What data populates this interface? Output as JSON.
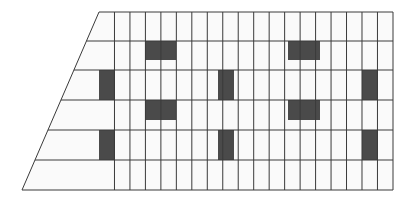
{
  "figure": {
    "background_color": "#ffffff",
    "line_color": "#3a3a3a",
    "fill_color": "#4a4a4a",
    "pane_color": "#fafafa",
    "line_width": 1
  },
  "geometry": {
    "outline_name": "facade-outline",
    "points": [
      {
        "x": 99,
        "y": 12
      },
      {
        "x": 393,
        "y": 12
      },
      {
        "x": 393,
        "y": 190
      },
      {
        "x": 22,
        "y": 190
      }
    ],
    "apex_top_left": {
      "x": 99,
      "y": 12
    },
    "base_bottom_left": {
      "x": 22,
      "y": 190
    },
    "right_edge_x": 393,
    "top_edge_y": 12,
    "bottom_edge_y": 190
  },
  "grid": {
    "name": "window-grid",
    "columns": 19,
    "rows": 6,
    "column_width": 15.47,
    "row_boundaries_y": [
      12,
      41,
      70,
      100,
      130,
      160,
      190
    ],
    "column_start_x": 99,
    "note": "Columns run full height on the right; on the left they are clipped by the slanted edge so lower rows extend further left."
  },
  "left_extension": {
    "name": "slanted-left-bays",
    "description": "Below each row boundary the facade widens to the left along the diagonal; extra vertical mullions fill these bays.",
    "bay_columns_per_row": [
      0,
      2,
      5,
      8,
      10,
      13
    ]
  },
  "lit_windows": {
    "name": "dark-window-blocks",
    "count": 10,
    "blocks": [
      {
        "id": "w1",
        "x": 145,
        "y": 41,
        "width": 31,
        "height": 19,
        "orientation": "horizontal",
        "row": 1,
        "col": 3
      },
      {
        "id": "w2",
        "x": 288,
        "y": 41,
        "width": 32,
        "height": 19,
        "orientation": "horizontal",
        "row": 1,
        "col": 12
      },
      {
        "id": "w3",
        "x": 99,
        "y": 70,
        "width": 16,
        "height": 30,
        "orientation": "vertical",
        "row": 2,
        "col": 0
      },
      {
        "id": "w4",
        "x": 218,
        "y": 70,
        "width": 16,
        "height": 30,
        "orientation": "vertical",
        "row": 2,
        "col": 8
      },
      {
        "id": "w5",
        "x": 362,
        "y": 70,
        "width": 16,
        "height": 30,
        "orientation": "vertical",
        "row": 2,
        "col": 17
      },
      {
        "id": "w6",
        "x": 145,
        "y": 100,
        "width": 31,
        "height": 20,
        "orientation": "horizontal",
        "row": 3,
        "col": 3
      },
      {
        "id": "w7",
        "x": 288,
        "y": 100,
        "width": 32,
        "height": 20,
        "orientation": "horizontal",
        "row": 3,
        "col": 12
      },
      {
        "id": "w8",
        "x": 99,
        "y": 130,
        "width": 16,
        "height": 30,
        "orientation": "vertical",
        "row": 4,
        "col": 0
      },
      {
        "id": "w9",
        "x": 218,
        "y": 130,
        "width": 16,
        "height": 30,
        "orientation": "vertical",
        "row": 4,
        "col": 8
      },
      {
        "id": "w10",
        "x": 362,
        "y": 130,
        "width": 16,
        "height": 30,
        "orientation": "vertical",
        "row": 4,
        "col": 17
      }
    ]
  }
}
